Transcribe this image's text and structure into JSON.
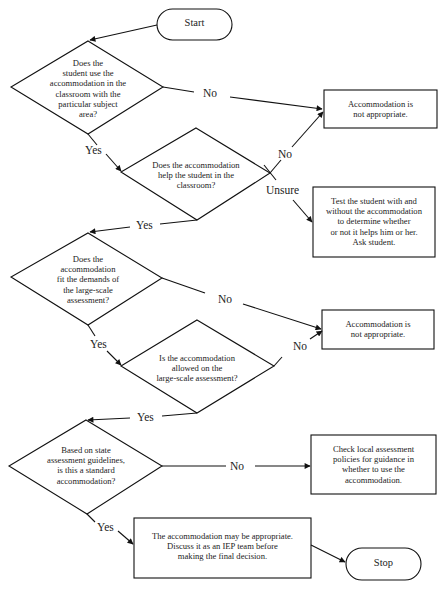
{
  "flowchart": {
    "start": {
      "label": "Start"
    },
    "stop": {
      "label": "Stop"
    },
    "decisions": [
      {
        "id": "d1",
        "text": "Does the\nstudent use the\naccommodation in the\nclassroom with the\nparticular subject\narea?"
      },
      {
        "id": "d2",
        "text": "Does the accommodation\nhelp the student in the\nclassroom?"
      },
      {
        "id": "d3",
        "text": "Does the\naccommodation\nfit the demands of\nthe large-scale\nassessment?"
      },
      {
        "id": "d4",
        "text": "Is the accommodation\nallowed on the\nlarge-scale assessment?"
      },
      {
        "id": "d5",
        "text": "Based on state\nassessment guidelines,\nis this a standard\naccommodation?"
      }
    ],
    "outcomes": [
      {
        "id": "o1",
        "text": "Accommodation is\nnot appropriate."
      },
      {
        "id": "o2",
        "text": "Test the student with and\nwithout the accommodation\nto determine whether\nor not it helps him or her.\nAsk student."
      },
      {
        "id": "o3",
        "text": "Accommodation is\nnot appropriate."
      },
      {
        "id": "o4",
        "text": "Check local assessment\npolicies for guidance in\nwhether to use the\naccommodation."
      },
      {
        "id": "o5",
        "text": "The accommodation may be appropriate.\nDiscuss it as an IEP team before\nmaking the final decision."
      }
    ],
    "edge_labels": {
      "d1_no": "No",
      "d1_yes": "Yes",
      "d2_no": "No",
      "d2_unsure": "Unsure",
      "d2_yes": "Yes",
      "d3_no": "No",
      "d3_yes": "Yes",
      "d4_no": "No",
      "d4_yes": "Yes",
      "d5_no": "No",
      "d5_yes": "Yes"
    }
  }
}
